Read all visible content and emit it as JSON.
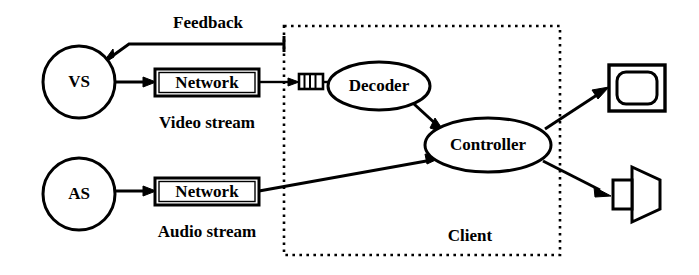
{
  "diagram": {
    "type": "block-flow-diagram",
    "title_visible": false,
    "background_color": "#ffffff",
    "stroke_color": "#000000",
    "nodes": {
      "video_source": {
        "label": "VS",
        "shape": "circle",
        "cx": 79,
        "cy": 82,
        "r": 36
      },
      "audio_source": {
        "label": "AS",
        "shape": "circle",
        "cx": 79,
        "cy": 194,
        "r": 36
      },
      "video_network": {
        "label": "Network",
        "shape": "double-rect",
        "x": 155,
        "y": 69,
        "w": 104,
        "h": 27
      },
      "audio_network": {
        "label": "Network",
        "shape": "double-rect",
        "x": 155,
        "y": 178,
        "w": 104,
        "h": 27
      },
      "buffer": {
        "label": "",
        "shape": "buffer-queue",
        "x": 299,
        "y": 74,
        "w": 24,
        "h": 15,
        "segments": 4
      },
      "decoder": {
        "label": "Decoder",
        "shape": "ellipse",
        "cx": 379,
        "cy": 86,
        "rx": 51,
        "ry": 24
      },
      "controller": {
        "label": "Controller",
        "shape": "ellipse",
        "cx": 488,
        "cy": 145,
        "rx": 63,
        "ry": 27
      },
      "monitor": {
        "label": "",
        "shape": "monitor-icon",
        "x": 609,
        "y": 65,
        "w": 56,
        "h": 46
      },
      "speaker": {
        "label": "",
        "shape": "speaker-icon",
        "x": 611,
        "y": 167,
        "w": 50,
        "h": 55
      }
    },
    "groups": [
      {
        "name": "client-boundary",
        "label": "Client",
        "border_style": "dotted",
        "x": 284,
        "y": 26,
        "w": 276,
        "h": 229,
        "label_x": 470,
        "label_y": 237
      }
    ],
    "edge_labels": [
      {
        "name": "feedback",
        "text": "Feedback",
        "x": 208,
        "y": 28
      },
      {
        "name": "video-stream",
        "text": "Video stream",
        "x": 207,
        "y": 122
      },
      {
        "name": "audio-stream",
        "text": "Audio stream",
        "x": 207,
        "y": 231
      }
    ],
    "edges": [
      {
        "name": "feedback-edge",
        "from": "client-boundary",
        "to": "video_source",
        "arrow": true
      },
      {
        "name": "vs-to-network-edge",
        "from": "video_source",
        "to": "video_network",
        "arrow": true
      },
      {
        "name": "network-to-buffer-edge",
        "from": "video_network",
        "to": "buffer",
        "arrow": true
      },
      {
        "name": "buffer-to-decoder-edge",
        "from": "buffer",
        "to": "decoder",
        "arrow": false
      },
      {
        "name": "decoder-to-controller-edge",
        "from": "decoder",
        "to": "controller",
        "arrow": true
      },
      {
        "name": "as-to-network-edge",
        "from": "audio_source",
        "to": "audio_network",
        "arrow": true
      },
      {
        "name": "audio-network-to-controller-edge",
        "from": "audio_network",
        "to": "controller",
        "arrow": true
      },
      {
        "name": "controller-to-monitor-edge",
        "from": "controller",
        "to": "monitor",
        "arrow": true
      },
      {
        "name": "controller-to-speaker-edge",
        "from": "controller",
        "to": "speaker",
        "arrow": true
      }
    ]
  }
}
